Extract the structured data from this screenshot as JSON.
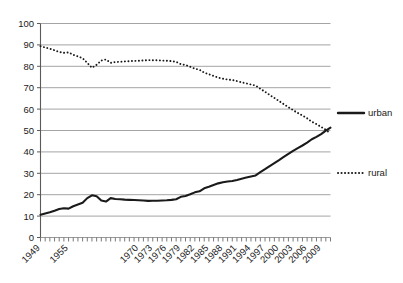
{
  "chart_data": {
    "type": "line",
    "title": "",
    "subtitle": "",
    "xlabel": "",
    "ylabel": "",
    "xlim": [
      1949,
      2011
    ],
    "ylim": [
      0,
      100
    ],
    "grid": "horizontal",
    "legend_position": "right",
    "y_ticks": [
      0,
      10,
      20,
      30,
      40,
      50,
      60,
      70,
      80,
      90,
      100
    ],
    "y_tick_labels": [
      "0",
      "10",
      "20",
      "30",
      "40",
      "50",
      "60",
      "70",
      "80",
      "90",
      "100"
    ],
    "x_tick_labels": [
      "1949",
      "1955",
      "1970",
      "1973",
      "1976",
      "1979",
      "1982",
      "1985",
      "1988",
      "1991",
      "1994",
      "1997",
      "2000",
      "2003",
      "2006",
      "2009"
    ],
    "x_tick_years": [
      1949,
      1955,
      1970,
      1973,
      1976,
      1979,
      1982,
      1985,
      1988,
      1991,
      1994,
      1997,
      2000,
      2003,
      2006,
      2009
    ],
    "x": [
      1949,
      1950,
      1951,
      1952,
      1953,
      1954,
      1955,
      1956,
      1957,
      1958,
      1959,
      1960,
      1961,
      1962,
      1963,
      1964,
      1965,
      1966,
      1967,
      1968,
      1969,
      1970,
      1971,
      1972,
      1973,
      1974,
      1975,
      1976,
      1977,
      1978,
      1979,
      1980,
      1981,
      1982,
      1983,
      1984,
      1985,
      1986,
      1987,
      1988,
      1989,
      1990,
      1991,
      1992,
      1993,
      1994,
      1995,
      1996,
      1997,
      1998,
      1999,
      2000,
      2001,
      2002,
      2003,
      2004,
      2005,
      2006,
      2007,
      2008,
      2009,
      2010,
      2011
    ],
    "series": [
      {
        "name": "urban",
        "style": "solid",
        "color": "#1a1a1a",
        "values": [
          10.6,
          11.2,
          11.8,
          12.5,
          13.3,
          13.7,
          13.5,
          14.6,
          15.4,
          16.2,
          18.4,
          19.7,
          19.3,
          17.3,
          16.8,
          18.4,
          18.0,
          17.9,
          17.7,
          17.6,
          17.5,
          17.4,
          17.3,
          17.1,
          17.2,
          17.2,
          17.3,
          17.4,
          17.6,
          17.9,
          19.0,
          19.4,
          20.2,
          21.1,
          21.6,
          23.0,
          23.7,
          24.5,
          25.3,
          25.8,
          26.2,
          26.4,
          26.9,
          27.5,
          28.0,
          28.5,
          29.0,
          30.5,
          31.9,
          33.4,
          34.8,
          36.2,
          37.7,
          39.1,
          40.5,
          41.8,
          43.0,
          44.3,
          45.9,
          47.0,
          48.3,
          49.9,
          51.3
        ]
      },
      {
        "name": "rural",
        "style": "dotted",
        "color": "#1a1a1a",
        "values": [
          89.4,
          88.8,
          88.2,
          87.5,
          86.7,
          86.3,
          86.5,
          85.4,
          84.6,
          83.8,
          81.6,
          79.3,
          80.7,
          82.7,
          83.2,
          81.6,
          82.0,
          82.1,
          82.3,
          82.4,
          82.5,
          82.6,
          82.7,
          82.9,
          82.8,
          82.8,
          82.7,
          82.6,
          82.4,
          82.1,
          81.0,
          80.6,
          79.8,
          78.9,
          78.4,
          77.0,
          76.3,
          75.5,
          74.7,
          74.2,
          73.8,
          73.6,
          73.1,
          72.5,
          72.0,
          71.5,
          71.0,
          69.5,
          68.1,
          66.6,
          65.2,
          63.8,
          62.3,
          60.9,
          59.5,
          58.2,
          57.0,
          55.7,
          54.1,
          53.0,
          51.7,
          50.3,
          48.7
        ]
      }
    ]
  },
  "legend": {
    "items": [
      {
        "label": "urban",
        "style": "solid"
      },
      {
        "label": "rural",
        "style": "dotted"
      }
    ]
  }
}
